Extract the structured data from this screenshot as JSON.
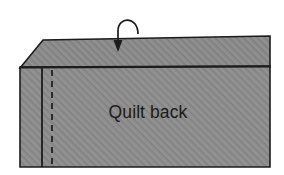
{
  "diagram": {
    "labels": {
      "quilt_back": "Quilt back"
    },
    "colors": {
      "fabric_fill": "#8c8c8c",
      "fabric_hatch": "#7e7e7e",
      "outline": "#1c1c1c",
      "stitch_line": "#1c1c1c",
      "arrow": "#1c1c1c",
      "background": "#ffffff",
      "text": "#1a1a1a"
    },
    "shapes": {
      "top_flap": {
        "name": "top-flap-band",
        "points": "20,68 43,40 270,36 270,67"
      },
      "body_panel": {
        "name": "quilt-body-panel",
        "points": "20,68 270,67 270,167 20,167"
      },
      "fold_edge_line": {
        "name": "fold-edge-line",
        "x1": 20,
        "y1": 67.5,
        "x2": 270,
        "y2": 66.5
      },
      "solid_seam_line": {
        "name": "solid-seam-line",
        "x": 42,
        "y1": 68,
        "y2": 167
      },
      "dashed_stitch_line": {
        "name": "dashed-stitch-line",
        "x": 52,
        "y1": 70,
        "y2": 167,
        "dash": "6,5"
      }
    },
    "arrow": {
      "name": "fold-direction-arrow",
      "path": "M 138,34 C 138,16 118,16 118,31 L 118,42",
      "head": "118,52 113.5,40 122.5,40"
    },
    "label_position": {
      "x": 148,
      "y": 118
    }
  }
}
